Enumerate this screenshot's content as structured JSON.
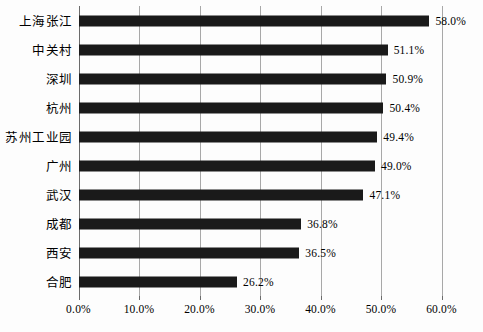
{
  "chart_data": {
    "type": "bar",
    "orientation": "horizontal",
    "title": "",
    "subtitle": "",
    "xlabel": "",
    "ylabel": "",
    "categories": [
      "上海张江",
      "中关村",
      "深圳",
      "杭州",
      "苏州工业园",
      "广州",
      "武汉",
      "成都",
      "西安",
      "合肥"
    ],
    "values": [
      58.0,
      51.1,
      50.9,
      50.4,
      49.4,
      49.0,
      47.1,
      36.8,
      36.5,
      26.2
    ],
    "value_labels": [
      "58.0%",
      "51.1%",
      "50.9%",
      "50.4%",
      "49.4%",
      "49.0%",
      "47.1%",
      "36.8%",
      "36.5%",
      "26.2%"
    ],
    "xlim": [
      0.0,
      60.0
    ],
    "xticks": [
      0.0,
      10.0,
      20.0,
      30.0,
      40.0,
      50.0,
      60.0
    ],
    "xtick_labels": [
      "0.0%",
      "10.0%",
      "20.0%",
      "30.0%",
      "40.0%",
      "50.0%",
      "60.0%"
    ],
    "grid": true,
    "grid_axis": "x",
    "legend": false,
    "legend_position": "none",
    "bar_color": "#1a1a1a",
    "gridline_color": "#a8a8a8",
    "axis_color": "#6b6b6b",
    "background_color": "#fdfdfd",
    "data_labels_shown": true
  }
}
